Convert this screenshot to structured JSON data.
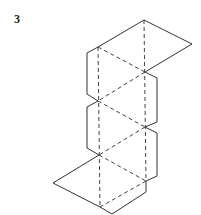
{
  "figure": {
    "label": "3",
    "colors": {
      "line": "#333333",
      "background": "#ffffff"
    },
    "outline_points": [
      [
        144,
        20
      ],
      [
        192,
        44
      ],
      [
        145,
        72
      ],
      [
        157,
        78
      ],
      [
        157,
        122
      ],
      [
        145,
        127
      ],
      [
        157,
        133
      ],
      [
        157,
        176
      ],
      [
        146,
        181
      ],
      [
        146,
        192
      ],
      [
        112,
        214
      ],
      [
        100,
        207
      ],
      [
        53,
        183
      ],
      [
        99,
        155
      ],
      [
        87,
        148
      ],
      [
        87,
        107
      ],
      [
        98,
        101
      ],
      [
        87,
        94
      ],
      [
        87,
        53
      ],
      [
        98,
        47
      ]
    ],
    "dashed_lines": [
      [
        [
          144,
          20
        ],
        [
          146,
          181
        ]
      ],
      [
        [
          98,
          47
        ],
        [
          100,
          207
        ]
      ],
      [
        [
          98,
          47
        ],
        [
          145,
          72
        ]
      ],
      [
        [
          145,
          72
        ],
        [
          98,
          101
        ]
      ],
      [
        [
          98,
          101
        ],
        [
          145,
          127
        ]
      ],
      [
        [
          145,
          127
        ],
        [
          99,
          155
        ]
      ],
      [
        [
          99,
          155
        ],
        [
          146,
          181
        ]
      ],
      [
        [
          146,
          181
        ],
        [
          100,
          207
        ]
      ]
    ]
  }
}
